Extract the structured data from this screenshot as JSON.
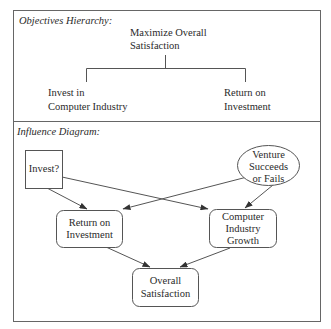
{
  "objectives_hierarchy": {
    "title": "Objectives Hierarchy:",
    "root": {
      "line1": "Maximize Overall",
      "line2": "Satisfaction"
    },
    "children": [
      {
        "line1": "Invest in",
        "line2": "Computer Industry"
      },
      {
        "line1": "Return on",
        "line2": "Investment"
      }
    ]
  },
  "influence_diagram": {
    "title": "Influence Diagram:",
    "nodes": {
      "decision": {
        "type": "decision",
        "shape": "rectangle",
        "lines": [
          "Invest?"
        ]
      },
      "chance": {
        "type": "chance",
        "shape": "ellipse",
        "lines": [
          "Venture",
          "Succeeds",
          "or Fails"
        ]
      },
      "roi": {
        "type": "consequence",
        "shape": "rounded-rectangle",
        "lines": [
          "Return on",
          "Investment"
        ]
      },
      "growth": {
        "type": "consequence",
        "shape": "rounded-rectangle",
        "lines": [
          "Computer",
          "Industry",
          "Growth"
        ]
      },
      "overall": {
        "type": "value",
        "shape": "rounded-rectangle",
        "lines": [
          "Overall",
          "Satisfaction"
        ]
      }
    },
    "edges": [
      {
        "from": "Invest?",
        "to": "Return on Investment"
      },
      {
        "from": "Invest?",
        "to": "Computer Industry Growth"
      },
      {
        "from": "Venture Succeeds or Fails",
        "to": "Return on Investment"
      },
      {
        "from": "Venture Succeeds or Fails",
        "to": "Computer Industry Growth"
      },
      {
        "from": "Return on Investment",
        "to": "Overall Satisfaction"
      },
      {
        "from": "Computer Industry Growth",
        "to": "Overall Satisfaction"
      }
    ]
  },
  "colors": {
    "line": "#555555",
    "text": "#2a2a2a",
    "background": "#ffffff"
  }
}
